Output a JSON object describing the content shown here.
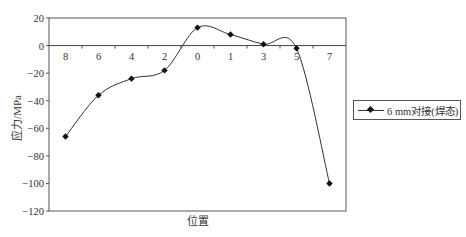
{
  "chart_data": {
    "type": "line",
    "title": "",
    "xlabel": "位置",
    "ylabel": "应力/MPa",
    "categories": [
      "8",
      "6",
      "4",
      "2",
      "0",
      "1",
      "3",
      "5",
      "7"
    ],
    "series": [
      {
        "name": "6 mm对接(焊态)",
        "values": [
          -66,
          -36,
          -24,
          -18,
          13,
          8,
          1,
          -2,
          -100
        ],
        "marker": "diamond",
        "color": "#111111",
        "smooth": true
      }
    ],
    "ylim": [
      -120,
      20
    ],
    "yticks": [
      20,
      0,
      -20,
      -40,
      -60,
      -80,
      -100,
      -120
    ],
    "ytick_labels": [
      "20",
      "0",
      "−20",
      "−40",
      "−60",
      "−80",
      "−100",
      "−120"
    ],
    "grid": false,
    "legend_position": "right",
    "x_axis_at_zero": true
  },
  "legend": {
    "label": "6 mm对接(焊态)"
  },
  "axes": {
    "xlabel": "位置",
    "ylabel": "应力/MPa"
  }
}
